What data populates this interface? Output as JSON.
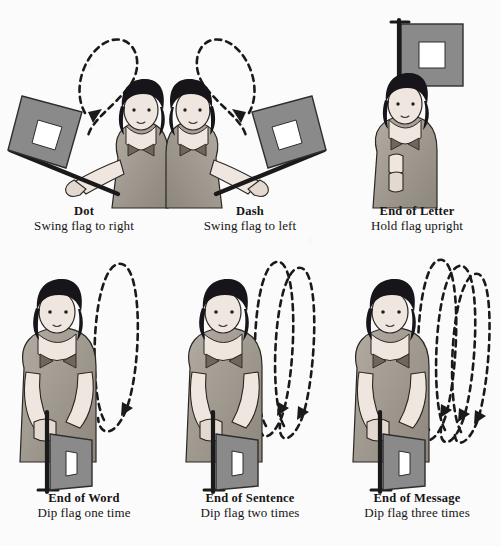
{
  "page": {
    "background_color": "#fbfbfb",
    "ink_color": "#151515",
    "flag_color": "#8a8a8a",
    "flag_center_color": "#ffffff",
    "staff_color": "#1a1a1a",
    "hair_color": "#17151a",
    "skin_color": "#efe6df",
    "blouse_color": "#9c958c"
  },
  "panels": [
    {
      "id": "dot",
      "title": "Dot",
      "subtitle": "Swing flag to right",
      "flag_position": "tilted-left-raised",
      "motion": "single-loop-to-right",
      "loops": 1,
      "arrow_direction": "down-left"
    },
    {
      "id": "dash",
      "title": "Dash",
      "subtitle": "Swing flag to left",
      "flag_position": "tilted-right-raised",
      "motion": "single-loop-to-left",
      "loops": 1,
      "arrow_direction": "down-right"
    },
    {
      "id": "end-of-letter",
      "title": "End of Letter",
      "subtitle": "Hold flag upright",
      "flag_position": "vertical-overhead",
      "motion": "none",
      "loops": 0,
      "arrow_direction": "none"
    },
    {
      "id": "end-of-word",
      "title": "End of Word",
      "subtitle": "Dip flag one time",
      "flag_position": "dipped-down",
      "motion": "dip-loops",
      "loops": 1,
      "arrow_direction": "down"
    },
    {
      "id": "end-of-sentence",
      "title": "End of Sentence",
      "subtitle": "Dip flag two times",
      "flag_position": "dipped-down",
      "motion": "dip-loops",
      "loops": 2,
      "arrow_direction": "down"
    },
    {
      "id": "end-of-message",
      "title": "End of Message",
      "subtitle": "Dip flag three times",
      "flag_position": "dipped-down",
      "motion": "dip-loops",
      "loops": 3,
      "arrow_direction": "down"
    }
  ]
}
